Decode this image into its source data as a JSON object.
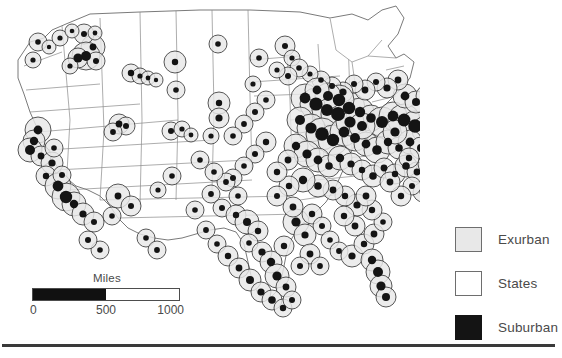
{
  "figure": {
    "type": "proportional-symbol-map",
    "region": "United States (contiguous)"
  },
  "scale_bar": {
    "title": "Miles",
    "ticks": [
      "0",
      "500",
      "1000"
    ],
    "min": 0,
    "mid": 500,
    "max": 1000,
    "filled_fraction": 0.5
  },
  "legend": {
    "items": [
      {
        "label": "Exurban",
        "swatch": "light-gray-square",
        "color": "#e8e8e8"
      },
      {
        "label": "States",
        "swatch": "white-square",
        "color": "#ffffff"
      },
      {
        "label": "Suburban",
        "swatch": "black-square",
        "color": "#141414"
      }
    ]
  },
  "colors": {
    "exurban_fill": "#e8e8e8",
    "exurban_stroke": "#3a3a3a",
    "suburban_fill": "#141414",
    "state_stroke": "#8a8a8a",
    "nation_stroke": "#6b6b6b",
    "rule": "#3a3a3a",
    "text": "#4a4a4a"
  },
  "chart_data": {
    "type": "scatter",
    "title": "",
    "xlabel": "",
    "ylabel": "",
    "note": "Proportional symbol map: each point is a metropolitan area. Outer light-gray circle radius encodes exurban extent; inner black dot radius encodes suburban extent.",
    "series": [
      {
        "name": "Exurban",
        "marker": "light-gray circle",
        "color": "#e8e8e8"
      },
      {
        "name": "Suburban",
        "marker": "black dot",
        "color": "#141414"
      }
    ],
    "points": [
      {
        "x": 93,
        "y": 47,
        "ex": 12,
        "sub": 3.4
      },
      {
        "x": 84,
        "y": 34,
        "ex": 10,
        "sub": 3.0
      },
      {
        "x": 95,
        "y": 33,
        "ex": 7,
        "sub": 2.4
      },
      {
        "x": 38,
        "y": 42,
        "ex": 9,
        "sub": 2.8
      },
      {
        "x": 33,
        "y": 60,
        "ex": 8,
        "sub": 2.6
      },
      {
        "x": 49,
        "y": 47,
        "ex": 7,
        "sub": 2.2
      },
      {
        "x": 60,
        "y": 38,
        "ex": 8,
        "sub": 2.6
      },
      {
        "x": 72,
        "y": 31,
        "ex": 7,
        "sub": 2.3
      },
      {
        "x": 86,
        "y": 56,
        "ex": 14,
        "sub": 5.0
      },
      {
        "x": 78,
        "y": 58,
        "ex": 10,
        "sub": 4.6
      },
      {
        "x": 96,
        "y": 61,
        "ex": 9,
        "sub": 3.0
      },
      {
        "x": 70,
        "y": 66,
        "ex": 8,
        "sub": 2.6
      },
      {
        "x": 131,
        "y": 73,
        "ex": 9,
        "sub": 3.2
      },
      {
        "x": 140,
        "y": 76,
        "ex": 8,
        "sub": 2.6
      },
      {
        "x": 148,
        "y": 78,
        "ex": 7,
        "sub": 2.4
      },
      {
        "x": 156,
        "y": 80,
        "ex": 7,
        "sub": 2.2
      },
      {
        "x": 175,
        "y": 62,
        "ex": 11,
        "sub": 3.2
      },
      {
        "x": 176,
        "y": 90,
        "ex": 9,
        "sub": 2.8
      },
      {
        "x": 218,
        "y": 44,
        "ex": 9,
        "sub": 2.8
      },
      {
        "x": 219,
        "y": 103,
        "ex": 11,
        "sub": 3.2
      },
      {
        "x": 219,
        "y": 118,
        "ex": 10,
        "sub": 3.6
      },
      {
        "x": 211,
        "y": 136,
        "ex": 8,
        "sub": 2.6
      },
      {
        "x": 259,
        "y": 58,
        "ex": 9,
        "sub": 2.8
      },
      {
        "x": 253,
        "y": 84,
        "ex": 8,
        "sub": 2.6
      },
      {
        "x": 285,
        "y": 46,
        "ex": 10,
        "sub": 3.0
      },
      {
        "x": 292,
        "y": 58,
        "ex": 8,
        "sub": 2.6
      },
      {
        "x": 119,
        "y": 124,
        "ex": 10,
        "sub": 3.4
      },
      {
        "x": 126,
        "y": 126,
        "ex": 9,
        "sub": 3.0
      },
      {
        "x": 113,
        "y": 132,
        "ex": 9,
        "sub": 2.9
      },
      {
        "x": 171,
        "y": 131,
        "ex": 9,
        "sub": 3.0
      },
      {
        "x": 182,
        "y": 129,
        "ex": 8,
        "sub": 2.6
      },
      {
        "x": 191,
        "y": 135,
        "ex": 7,
        "sub": 2.4
      },
      {
        "x": 38,
        "y": 130,
        "ex": 13,
        "sub": 4.4
      },
      {
        "x": 34,
        "y": 141,
        "ex": 11,
        "sub": 4.2
      },
      {
        "x": 30,
        "y": 150,
        "ex": 12,
        "sub": 5.0
      },
      {
        "x": 41,
        "y": 156,
        "ex": 10,
        "sub": 3.4
      },
      {
        "x": 52,
        "y": 163,
        "ex": 11,
        "sub": 3.6
      },
      {
        "x": 46,
        "y": 176,
        "ex": 10,
        "sub": 3.2
      },
      {
        "x": 58,
        "y": 186,
        "ex": 13,
        "sub": 5.4
      },
      {
        "x": 66,
        "y": 197,
        "ex": 14,
        "sub": 6.2
      },
      {
        "x": 74,
        "y": 204,
        "ex": 12,
        "sub": 4.2
      },
      {
        "x": 83,
        "y": 214,
        "ex": 11,
        "sub": 3.6
      },
      {
        "x": 94,
        "y": 222,
        "ex": 10,
        "sub": 3.0
      },
      {
        "x": 62,
        "y": 175,
        "ex": 9,
        "sub": 3.0
      },
      {
        "x": 54,
        "y": 148,
        "ex": 9,
        "sub": 2.8
      },
      {
        "x": 118,
        "y": 196,
        "ex": 12,
        "sub": 3.4
      },
      {
        "x": 131,
        "y": 206,
        "ex": 10,
        "sub": 3.0
      },
      {
        "x": 112,
        "y": 216,
        "ex": 9,
        "sub": 2.8
      },
      {
        "x": 172,
        "y": 176,
        "ex": 9,
        "sub": 2.8
      },
      {
        "x": 158,
        "y": 190,
        "ex": 8,
        "sub": 2.6
      },
      {
        "x": 211,
        "y": 194,
        "ex": 9,
        "sub": 2.9
      },
      {
        "x": 222,
        "y": 208,
        "ex": 9,
        "sub": 3.0
      },
      {
        "x": 236,
        "y": 215,
        "ex": 10,
        "sub": 3.2
      },
      {
        "x": 247,
        "y": 222,
        "ex": 12,
        "sub": 4.0
      },
      {
        "x": 258,
        "y": 231,
        "ex": 10,
        "sub": 3.2
      },
      {
        "x": 249,
        "y": 243,
        "ex": 9,
        "sub": 2.8
      },
      {
        "x": 262,
        "y": 252,
        "ex": 10,
        "sub": 3.6
      },
      {
        "x": 271,
        "y": 262,
        "ex": 11,
        "sub": 4.2
      },
      {
        "x": 277,
        "y": 276,
        "ex": 12,
        "sub": 4.6
      },
      {
        "x": 286,
        "y": 287,
        "ex": 10,
        "sub": 3.4
      },
      {
        "x": 296,
        "y": 222,
        "ex": 13,
        "sub": 4.6
      },
      {
        "x": 305,
        "y": 235,
        "ex": 11,
        "sub": 3.6
      },
      {
        "x": 312,
        "y": 214,
        "ex": 10,
        "sub": 3.2
      },
      {
        "x": 322,
        "y": 226,
        "ex": 9,
        "sub": 3.0
      },
      {
        "x": 330,
        "y": 240,
        "ex": 9,
        "sub": 2.8
      },
      {
        "x": 339,
        "y": 251,
        "ex": 9,
        "sub": 2.9
      },
      {
        "x": 352,
        "y": 256,
        "ex": 11,
        "sub": 3.6
      },
      {
        "x": 364,
        "y": 244,
        "ex": 10,
        "sub": 3.2
      },
      {
        "x": 374,
        "y": 234,
        "ex": 10,
        "sub": 3.4
      },
      {
        "x": 383,
        "y": 222,
        "ex": 9,
        "sub": 2.8
      },
      {
        "x": 372,
        "y": 210,
        "ex": 10,
        "sub": 3.2
      },
      {
        "x": 357,
        "y": 205,
        "ex": 11,
        "sub": 3.6
      },
      {
        "x": 345,
        "y": 196,
        "ex": 10,
        "sub": 3.2
      },
      {
        "x": 333,
        "y": 190,
        "ex": 10,
        "sub": 3.4
      },
      {
        "x": 318,
        "y": 186,
        "ex": 11,
        "sub": 3.8
      },
      {
        "x": 303,
        "y": 180,
        "ex": 12,
        "sub": 4.2
      },
      {
        "x": 289,
        "y": 186,
        "ex": 10,
        "sub": 3.2
      },
      {
        "x": 277,
        "y": 196,
        "ex": 10,
        "sub": 3.0
      },
      {
        "x": 372,
        "y": 260,
        "ex": 11,
        "sub": 4.2
      },
      {
        "x": 378,
        "y": 272,
        "ex": 12,
        "sub": 5.0
      },
      {
        "x": 381,
        "y": 286,
        "ex": 11,
        "sub": 4.6
      },
      {
        "x": 386,
        "y": 297,
        "ex": 10,
        "sub": 4.0
      },
      {
        "x": 305,
        "y": 98,
        "ex": 14,
        "sub": 5.4
      },
      {
        "x": 316,
        "y": 104,
        "ex": 16,
        "sub": 6.6
      },
      {
        "x": 327,
        "y": 110,
        "ex": 15,
        "sub": 6.0
      },
      {
        "x": 338,
        "y": 114,
        "ex": 17,
        "sub": 7.0
      },
      {
        "x": 349,
        "y": 108,
        "ex": 16,
        "sub": 6.2
      },
      {
        "x": 360,
        "y": 112,
        "ex": 14,
        "sub": 5.2
      },
      {
        "x": 371,
        "y": 118,
        "ex": 13,
        "sub": 4.8
      },
      {
        "x": 382,
        "y": 122,
        "ex": 15,
        "sub": 6.0
      },
      {
        "x": 393,
        "y": 116,
        "ex": 14,
        "sub": 5.4
      },
      {
        "x": 404,
        "y": 120,
        "ex": 16,
        "sub": 6.4
      },
      {
        "x": 415,
        "y": 126,
        "ex": 15,
        "sub": 6.8
      },
      {
        "x": 426,
        "y": 130,
        "ex": 14,
        "sub": 6.0
      },
      {
        "x": 437,
        "y": 124,
        "ex": 13,
        "sub": 5.0
      },
      {
        "x": 448,
        "y": 118,
        "ex": 12,
        "sub": 4.4
      },
      {
        "x": 459,
        "y": 112,
        "ex": 11,
        "sub": 4.0
      },
      {
        "x": 470,
        "y": 106,
        "ex": 10,
        "sub": 3.4
      },
      {
        "x": 300,
        "y": 120,
        "ex": 13,
        "sub": 5.0
      },
      {
        "x": 311,
        "y": 128,
        "ex": 14,
        "sub": 5.6
      },
      {
        "x": 322,
        "y": 134,
        "ex": 16,
        "sub": 6.8
      },
      {
        "x": 333,
        "y": 140,
        "ex": 15,
        "sub": 6.2
      },
      {
        "x": 344,
        "y": 132,
        "ex": 14,
        "sub": 5.4
      },
      {
        "x": 355,
        "y": 138,
        "ex": 13,
        "sub": 5.0
      },
      {
        "x": 366,
        "y": 144,
        "ex": 12,
        "sub": 4.4
      },
      {
        "x": 377,
        "y": 150,
        "ex": 13,
        "sub": 4.8
      },
      {
        "x": 388,
        "y": 142,
        "ex": 12,
        "sub": 4.2
      },
      {
        "x": 399,
        "y": 148,
        "ex": 11,
        "sub": 3.8
      },
      {
        "x": 410,
        "y": 142,
        "ex": 12,
        "sub": 4.4
      },
      {
        "x": 421,
        "y": 148,
        "ex": 11,
        "sub": 4.0
      },
      {
        "x": 432,
        "y": 142,
        "ex": 10,
        "sub": 3.4
      },
      {
        "x": 443,
        "y": 136,
        "ex": 10,
        "sub": 3.6
      },
      {
        "x": 296,
        "y": 146,
        "ex": 12,
        "sub": 4.2
      },
      {
        "x": 307,
        "y": 154,
        "ex": 13,
        "sub": 4.6
      },
      {
        "x": 318,
        "y": 160,
        "ex": 12,
        "sub": 4.4
      },
      {
        "x": 329,
        "y": 166,
        "ex": 11,
        "sub": 3.8
      },
      {
        "x": 340,
        "y": 158,
        "ex": 12,
        "sub": 4.2
      },
      {
        "x": 351,
        "y": 164,
        "ex": 11,
        "sub": 3.6
      },
      {
        "x": 362,
        "y": 170,
        "ex": 10,
        "sub": 3.2
      },
      {
        "x": 373,
        "y": 176,
        "ex": 11,
        "sub": 3.8
      },
      {
        "x": 384,
        "y": 168,
        "ex": 10,
        "sub": 3.4
      },
      {
        "x": 395,
        "y": 174,
        "ex": 10,
        "sub": 3.2
      },
      {
        "x": 406,
        "y": 166,
        "ex": 11,
        "sub": 3.8
      },
      {
        "x": 417,
        "y": 172,
        "ex": 10,
        "sub": 3.4
      },
      {
        "x": 428,
        "y": 164,
        "ex": 10,
        "sub": 3.6
      },
      {
        "x": 405,
        "y": 96,
        "ex": 12,
        "sub": 4.4
      },
      {
        "x": 416,
        "y": 102,
        "ex": 11,
        "sub": 4.0
      },
      {
        "x": 427,
        "y": 96,
        "ex": 11,
        "sub": 4.2
      },
      {
        "x": 438,
        "y": 102,
        "ex": 12,
        "sub": 4.6
      },
      {
        "x": 449,
        "y": 96,
        "ex": 11,
        "sub": 4.0
      },
      {
        "x": 460,
        "y": 90,
        "ex": 10,
        "sub": 3.4
      },
      {
        "x": 471,
        "y": 84,
        "ex": 9,
        "sub": 3.0
      },
      {
        "x": 482,
        "y": 92,
        "ex": 11,
        "sub": 5.2
      },
      {
        "x": 493,
        "y": 100,
        "ex": 10,
        "sub": 3.6
      },
      {
        "x": 466,
        "y": 128,
        "ex": 13,
        "sub": 5.6
      },
      {
        "x": 477,
        "y": 122,
        "ex": 12,
        "sub": 5.0
      },
      {
        "x": 488,
        "y": 116,
        "ex": 11,
        "sub": 4.2
      },
      {
        "x": 499,
        "y": 110,
        "ex": 10,
        "sub": 3.4
      },
      {
        "x": 459,
        "y": 146,
        "ex": 11,
        "sub": 4.0
      },
      {
        "x": 470,
        "y": 152,
        "ex": 10,
        "sub": 3.4
      },
      {
        "x": 481,
        "y": 140,
        "ex": 10,
        "sub": 3.2
      },
      {
        "x": 492,
        "y": 134,
        "ex": 9,
        "sub": 3.0
      },
      {
        "x": 445,
        "y": 160,
        "ex": 10,
        "sub": 3.4
      },
      {
        "x": 434,
        "y": 180,
        "ex": 10,
        "sub": 3.2
      },
      {
        "x": 423,
        "y": 192,
        "ex": 10,
        "sub": 3.4
      },
      {
        "x": 412,
        "y": 186,
        "ex": 9,
        "sub": 3.0
      },
      {
        "x": 401,
        "y": 196,
        "ex": 10,
        "sub": 3.2
      },
      {
        "x": 447,
        "y": 186,
        "ex": 9,
        "sub": 2.8
      },
      {
        "x": 458,
        "y": 174,
        "ex": 9,
        "sub": 3.0
      },
      {
        "x": 500,
        "y": 56,
        "ex": 9,
        "sub": 2.8
      },
      {
        "x": 489,
        "y": 70,
        "ex": 9,
        "sub": 2.9
      },
      {
        "x": 478,
        "y": 64,
        "ex": 8,
        "sub": 2.6
      },
      {
        "x": 398,
        "y": 80,
        "ex": 10,
        "sub": 3.4
      },
      {
        "x": 387,
        "y": 88,
        "ex": 10,
        "sub": 3.6
      },
      {
        "x": 376,
        "y": 82,
        "ex": 9,
        "sub": 3.0
      },
      {
        "x": 365,
        "y": 90,
        "ex": 10,
        "sub": 3.4
      },
      {
        "x": 354,
        "y": 84,
        "ex": 9,
        "sub": 3.0
      },
      {
        "x": 343,
        "y": 92,
        "ex": 10,
        "sub": 3.6
      },
      {
        "x": 332,
        "y": 86,
        "ex": 9,
        "sub": 3.0
      },
      {
        "x": 321,
        "y": 80,
        "ex": 9,
        "sub": 2.8
      },
      {
        "x": 310,
        "y": 74,
        "ex": 8,
        "sub": 2.6
      },
      {
        "x": 299,
        "y": 68,
        "ex": 9,
        "sub": 2.8
      },
      {
        "x": 288,
        "y": 76,
        "ex": 9,
        "sub": 3.0
      },
      {
        "x": 277,
        "y": 70,
        "ex": 8,
        "sub": 2.6
      },
      {
        "x": 266,
        "y": 100,
        "ex": 9,
        "sub": 2.8
      },
      {
        "x": 255,
        "y": 112,
        "ex": 9,
        "sub": 3.0
      },
      {
        "x": 244,
        "y": 124,
        "ex": 9,
        "sub": 2.9
      },
      {
        "x": 233,
        "y": 136,
        "ex": 9,
        "sub": 2.8
      },
      {
        "x": 266,
        "y": 142,
        "ex": 10,
        "sub": 3.2
      },
      {
        "x": 255,
        "y": 154,
        "ex": 9,
        "sub": 3.0
      },
      {
        "x": 244,
        "y": 166,
        "ex": 9,
        "sub": 2.8
      },
      {
        "x": 233,
        "y": 178,
        "ex": 9,
        "sub": 3.0
      },
      {
        "x": 288,
        "y": 160,
        "ex": 10,
        "sub": 3.4
      },
      {
        "x": 277,
        "y": 172,
        "ex": 10,
        "sub": 3.2
      },
      {
        "x": 200,
        "y": 160,
        "ex": 9,
        "sub": 2.8
      },
      {
        "x": 195,
        "y": 210,
        "ex": 9,
        "sub": 2.8
      },
      {
        "x": 206,
        "y": 230,
        "ex": 9,
        "sub": 2.9
      },
      {
        "x": 217,
        "y": 244,
        "ex": 9,
        "sub": 2.8
      },
      {
        "x": 228,
        "y": 256,
        "ex": 10,
        "sub": 3.2
      },
      {
        "x": 239,
        "y": 268,
        "ex": 10,
        "sub": 3.4
      },
      {
        "x": 250,
        "y": 280,
        "ex": 11,
        "sub": 4.0
      },
      {
        "x": 261,
        "y": 292,
        "ex": 10,
        "sub": 3.6
      },
      {
        "x": 272,
        "y": 300,
        "ex": 10,
        "sub": 3.8
      },
      {
        "x": 283,
        "y": 308,
        "ex": 9,
        "sub": 3.2
      },
      {
        "x": 292,
        "y": 300,
        "ex": 9,
        "sub": 3.0
      },
      {
        "x": 146,
        "y": 238,
        "ex": 9,
        "sub": 2.8
      },
      {
        "x": 157,
        "y": 250,
        "ex": 9,
        "sub": 2.9
      },
      {
        "x": 100,
        "y": 250,
        "ex": 9,
        "sub": 2.8
      },
      {
        "x": 88,
        "y": 240,
        "ex": 9,
        "sub": 3.0
      },
      {
        "x": 390,
        "y": 182,
        "ex": 10,
        "sub": 3.4
      },
      {
        "x": 409,
        "y": 158,
        "ex": 10,
        "sub": 3.2
      },
      {
        "x": 355,
        "y": 226,
        "ex": 10,
        "sub": 3.4
      },
      {
        "x": 344,
        "y": 216,
        "ex": 10,
        "sub": 3.2
      },
      {
        "x": 366,
        "y": 196,
        "ex": 10,
        "sub": 3.4
      },
      {
        "x": 293,
        "y": 207,
        "ex": 10,
        "sub": 3.4
      },
      {
        "x": 284,
        "y": 246,
        "ex": 10,
        "sub": 3.2
      },
      {
        "x": 310,
        "y": 254,
        "ex": 10,
        "sub": 3.4
      },
      {
        "x": 320,
        "y": 266,
        "ex": 9,
        "sub": 2.9
      },
      {
        "x": 300,
        "y": 266,
        "ex": 9,
        "sub": 3.0
      },
      {
        "x": 238,
        "y": 196,
        "ex": 9,
        "sub": 2.8
      },
      {
        "x": 226,
        "y": 182,
        "ex": 9,
        "sub": 2.9
      },
      {
        "x": 214,
        "y": 172,
        "ex": 9,
        "sub": 2.8
      },
      {
        "x": 395,
        "y": 132,
        "ex": 12,
        "sub": 4.6
      },
      {
        "x": 350,
        "y": 122,
        "ex": 14,
        "sub": 5.6
      },
      {
        "x": 362,
        "y": 126,
        "ex": 13,
        "sub": 5.0
      },
      {
        "x": 339,
        "y": 100,
        "ex": 15,
        "sub": 6.2
      },
      {
        "x": 328,
        "y": 96,
        "ex": 13,
        "sub": 5.0
      },
      {
        "x": 317,
        "y": 90,
        "ex": 12,
        "sub": 4.4
      }
    ]
  }
}
